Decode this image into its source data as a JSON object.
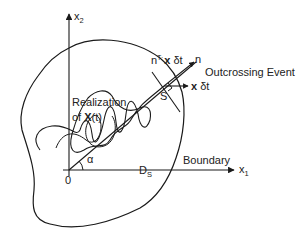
{
  "figure": {
    "type": "diagram",
    "axes": {
      "x_axis_label": "x",
      "x_axis_subscript": "1",
      "y_axis_label": "x",
      "y_axis_subscript": "2",
      "origin_label": "0"
    },
    "labels": {
      "realization_line1": "Realization",
      "realization_line2_prefix": "of ",
      "realization_line2_bold": "X",
      "realization_line2_suffix": "(t)",
      "outcrossing_event": "Outcrossing Event",
      "velocity_bold": "x",
      "velocity_suffix": " δt",
      "normal_component_prefix": "n",
      "normal_component_sup": "T·",
      "normal_component_bold": "x",
      "normal_component_suffix": " δt",
      "normal": "n",
      "point_s": "S",
      "safe_domain": "D",
      "safe_domain_subscript": "S",
      "boundary": "Boundary",
      "angle": "α"
    },
    "colors": {
      "stroke": "#1a1a1a",
      "text": "#222222",
      "background": "#ffffff"
    }
  }
}
